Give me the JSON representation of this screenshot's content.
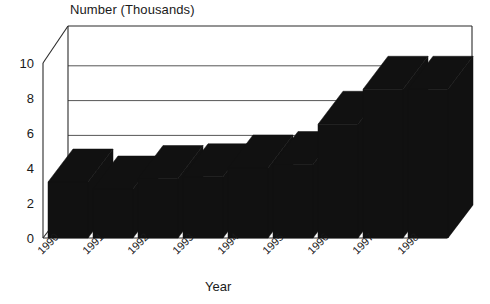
{
  "chart_data": {
    "type": "bar",
    "title": "Number (Thousands)",
    "subtitle": "",
    "xlabel": "Year",
    "ylabel": "Number (Thousands)",
    "categories": [
      "1990",
      "1991",
      "1992",
      "1993",
      "1994",
      "1995",
      "1996",
      "1997",
      "1998"
    ],
    "values": [
      3.2,
      2.8,
      3.4,
      3.5,
      4.0,
      4.2,
      6.5,
      8.5,
      8.5
    ],
    "series": [
      {
        "name": "Number (Thousands)",
        "values": [
          3.2,
          2.8,
          3.4,
          3.5,
          4.0,
          4.2,
          6.5,
          8.5,
          8.5
        ]
      }
    ],
    "yticks": [
      "0",
      "2",
      "4",
      "6",
      "8",
      "10"
    ],
    "ytick_values": [
      0,
      2,
      4,
      6,
      8,
      10
    ],
    "ylim": [
      0,
      10
    ],
    "grid": true,
    "legend": false,
    "legend_position": "none",
    "style": "3d-bar",
    "bar_color": "#111111",
    "axis_color": "#2b2b2b",
    "background_color": "#ffffff",
    "xtick_rotation": -45
  },
  "axis": {
    "x_title": "Year",
    "y_title": "Number (Thousands)"
  }
}
